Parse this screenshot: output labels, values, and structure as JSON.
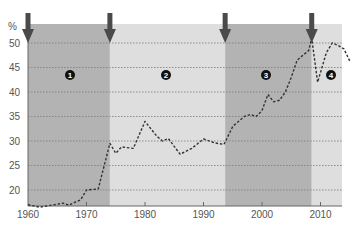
{
  "chart_data": {
    "type": "line",
    "title": "",
    "xlabel": "",
    "ylabel": "%",
    "xlim": [
      1960,
      2015
    ],
    "ylim": [
      16.5,
      52
    ],
    "grid": "horizontal dotted",
    "legend": null,
    "x_ticks": [
      1960,
      1970,
      1980,
      1990,
      2000,
      2010
    ],
    "y_ticks": [
      20,
      25,
      30,
      35,
      40,
      45,
      50
    ],
    "series": [
      {
        "name": "share",
        "style": "dashed",
        "color": "#333333",
        "x": [
          1960,
          1962,
          1963,
          1965,
          1966,
          1967,
          1968,
          1969,
          1970,
          1972,
          1974,
          1975,
          1976,
          1978,
          1980,
          1982,
          1983,
          1984,
          1986,
          1988,
          1990,
          1992,
          1993.5,
          1995,
          1997,
          1998,
          1999,
          2000,
          2001,
          2002,
          2003,
          2004,
          2005,
          2006,
          2007,
          2008,
          2008.5,
          2009.5,
          2011,
          2012,
          2013,
          2014,
          2015
        ],
        "values": [
          17.0,
          16.5,
          16.7,
          17.1,
          17.3,
          16.9,
          17.5,
          18.0,
          20.0,
          20.2,
          29.5,
          27.5,
          28.8,
          28.5,
          34.0,
          31.0,
          30.0,
          30.5,
          27.3,
          28.5,
          30.4,
          29.6,
          29.3,
          33.0,
          35.0,
          35.4,
          35.0,
          36.2,
          39.5,
          38.0,
          38.3,
          40.0,
          43.0,
          46.5,
          47.5,
          48.5,
          51.0,
          42.0,
          48.0,
          50.0,
          49.5,
          48.8,
          46.3
        ]
      }
    ],
    "regions": [
      {
        "label": "1",
        "start": 1960,
        "end": 1974,
        "shade": "dark"
      },
      {
        "label": "2",
        "start": 1974,
        "end": 1993.7,
        "shade": "light"
      },
      {
        "label": "3",
        "start": 1993.7,
        "end": 2008.5,
        "shade": "dark"
      },
      {
        "label": "4",
        "start": 2008.5,
        "end": 2013.8,
        "shade": "light"
      }
    ],
    "annotations": [
      {
        "type": "arrow-down",
        "x": 1960
      },
      {
        "type": "arrow-down",
        "x": 1974
      },
      {
        "type": "arrow-down",
        "x": 1993.7
      },
      {
        "type": "arrow-down",
        "x": 2008.5
      }
    ]
  },
  "colors": {
    "region_dark": "#b3b3b3",
    "region_light": "#dedede",
    "arrow": "#4a4a4a",
    "badge": "#111111",
    "grid": "#7a7a7a",
    "axis": "#666666"
  }
}
